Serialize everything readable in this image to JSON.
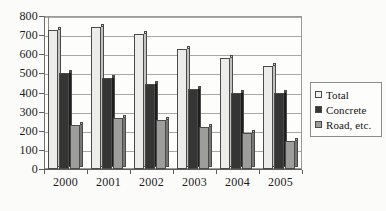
{
  "chart_data": {
    "type": "bar",
    "title": "",
    "xlabel": "",
    "ylabel": "",
    "categories": [
      "2000",
      "2001",
      "2002",
      "2003",
      "2004",
      "2005"
    ],
    "series": [
      {
        "name": "Total",
        "values": [
          725,
          740,
          705,
          630,
          580,
          540
        ],
        "color": "#ececea"
      },
      {
        "name": "Concrete",
        "values": [
          500,
          478,
          447,
          420,
          398,
          400
        ],
        "color": "#353535"
      },
      {
        "name": "Road, etc.",
        "values": [
          232,
          265,
          255,
          218,
          188,
          148
        ],
        "color": "#9d9d9b"
      }
    ],
    "ylim": [
      0,
      800
    ],
    "ytick_step": 100,
    "yticks": [
      "800",
      "700",
      "600",
      "500",
      "400",
      "300",
      "200",
      "100",
      "0"
    ],
    "grid": true,
    "legend_position": "right"
  },
  "legend": {
    "items": [
      {
        "label": "Total",
        "swatch": "legend-swatch-total"
      },
      {
        "label": "Concrete",
        "swatch": "legend-swatch-concrete"
      },
      {
        "label": "Road, etc.",
        "swatch": "legend-swatch-road"
      }
    ]
  }
}
